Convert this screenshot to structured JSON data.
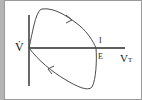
{
  "diagram": {
    "type": "flow-volume loop",
    "y_axis_label": "V̇",
    "x_axis_label": "V",
    "x_axis_subscript": "T",
    "point_labels": {
      "inspiration": "I",
      "expiration": "E"
    },
    "colors": {
      "line": "#3a3a3a",
      "background": "#ffffff",
      "side_bar": "#b4b4b4"
    }
  }
}
